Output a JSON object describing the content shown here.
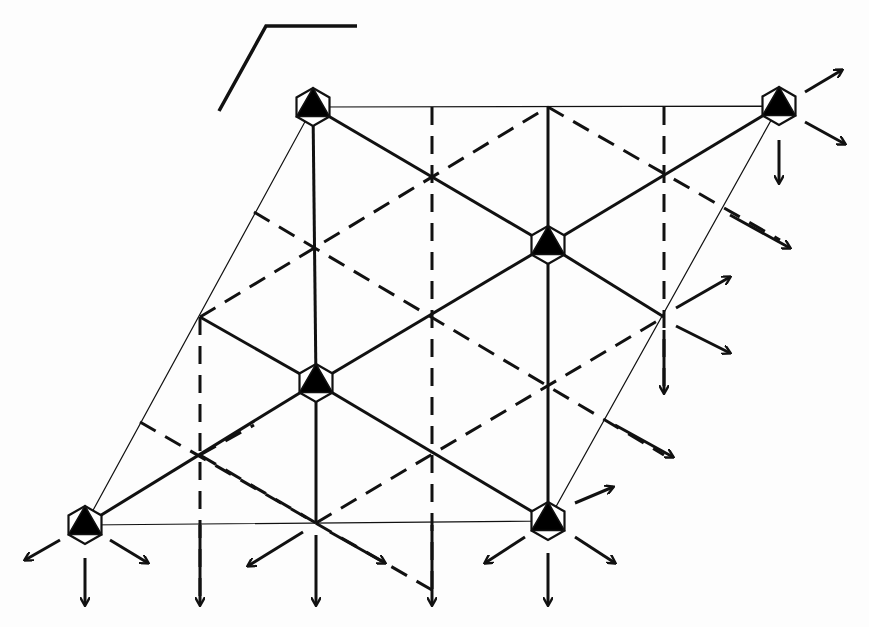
{
  "diagram": {
    "type": "symmetry-lattice",
    "colors": {
      "ink": "#111111",
      "background": "#fdfdfd",
      "fill": "#000000"
    },
    "corner_mark": {
      "points": [
        [
          219,
          111
        ],
        [
          266,
          26
        ],
        [
          357,
          26
        ]
      ]
    },
    "unit_cell": {
      "corners": [
        [
          85,
          525
        ],
        [
          548,
          521
        ],
        [
          779,
          106
        ],
        [
          313,
          107
        ]
      ]
    },
    "threefold_sites": [
      {
        "id": "tl",
        "x": 313,
        "y": 107
      },
      {
        "id": "tr",
        "x": 779,
        "y": 106
      },
      {
        "id": "c1",
        "x": 548,
        "y": 245
      },
      {
        "id": "c2",
        "x": 316,
        "y": 383
      },
      {
        "id": "bl",
        "x": 85,
        "y": 525
      },
      {
        "id": "br",
        "x": 548,
        "y": 521
      }
    ],
    "solid_lines": [
      [
        [
          313,
          107
        ],
        [
          548,
          245
        ]
      ],
      [
        [
          548,
          245
        ],
        [
          664,
          317
        ]
      ],
      [
        [
          548,
          245
        ],
        [
          779,
          106
        ]
      ],
      [
        [
          548,
          245
        ],
        [
          548,
          107
        ]
      ],
      [
        [
          548,
          245
        ],
        [
          548,
          521
        ]
      ],
      [
        [
          313,
          107
        ],
        [
          316,
          383
        ]
      ],
      [
        [
          316,
          383
        ],
        [
          316,
          523
        ]
      ],
      [
        [
          316,
          383
        ],
        [
          548,
          245
        ]
      ],
      [
        [
          316,
          383
        ],
        [
          200,
          317
        ]
      ],
      [
        [
          316,
          383
        ],
        [
          85,
          525
        ]
      ],
      [
        [
          316,
          383
        ],
        [
          548,
          521
        ]
      ]
    ],
    "dashed_lines": [
      [
        [
          200,
          317
        ],
        [
          548,
          107
        ]
      ],
      [
        [
          254,
          212
        ],
        [
          664,
          455
        ]
      ],
      [
        [
          140,
          422
        ],
        [
          432,
          590
        ]
      ],
      [
        [
          316,
          523
        ],
        [
          664,
          317
        ]
      ],
      [
        [
          432,
          107
        ],
        [
          432,
          600
        ]
      ],
      [
        [
          664,
          107
        ],
        [
          664,
          390
        ]
      ],
      [
        [
          200,
          317
        ],
        [
          200,
          600
        ]
      ],
      [
        [
          548,
          107
        ],
        [
          780,
          240
        ]
      ],
      [
        [
          200,
          455
        ],
        [
          254,
          425
        ]
      ],
      [
        [
          316,
          523
        ],
        [
          200,
          455
        ]
      ]
    ],
    "arrows": [
      {
        "from": [
          805,
          92
        ],
        "to": [
          842,
          70
        ]
      },
      {
        "from": [
          805,
          122
        ],
        "to": [
          845,
          144
        ]
      },
      {
        "from": [
          779,
          140
        ],
        "to": [
          779,
          183
        ]
      },
      {
        "from": [
          60,
          540
        ],
        "to": [
          25,
          560
        ]
      },
      {
        "from": [
          110,
          540
        ],
        "to": [
          148,
          563
        ]
      },
      {
        "from": [
          85,
          558
        ],
        "to": [
          85,
          605
        ]
      },
      {
        "from": [
          303,
          532
        ],
        "to": [
          248,
          566
        ]
      },
      {
        "from": [
          330,
          532
        ],
        "to": [
          385,
          563
        ]
      },
      {
        "from": [
          316,
          535
        ],
        "to": [
          316,
          605
        ]
      },
      {
        "from": [
          525,
          537
        ],
        "to": [
          485,
          563
        ]
      },
      {
        "from": [
          575,
          503
        ],
        "to": [
          613,
          487
        ]
      },
      {
        "from": [
          575,
          537
        ],
        "to": [
          615,
          563
        ]
      },
      {
        "from": [
          548,
          553
        ],
        "to": [
          548,
          605
        ]
      },
      {
        "from": [
          200,
          525
        ],
        "to": [
          200,
          605
        ]
      },
      {
        "from": [
          432,
          525
        ],
        "to": [
          432,
          605
        ]
      },
      {
        "from": [
          676,
          308
        ],
        "to": [
          730,
          277
        ]
      },
      {
        "from": [
          676,
          326
        ],
        "to": [
          730,
          353
        ]
      },
      {
        "from": [
          664,
          330
        ],
        "to": [
          664,
          393
        ]
      },
      {
        "from": [
          615,
          425
        ],
        "to": [
          673,
          457
        ]
      },
      {
        "from": [
          730,
          215
        ],
        "to": [
          790,
          248
        ]
      }
    ],
    "text_labels": []
  }
}
